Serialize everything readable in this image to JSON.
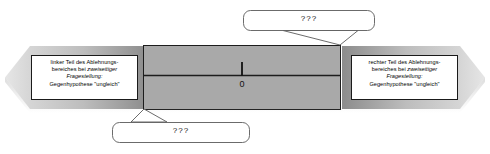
{
  "figure": {
    "axis": {
      "center_tick_label": "0",
      "center_tick_value": 0
    },
    "colors": {
      "band_light": "#d9d9d9",
      "band_mid": "#b4b4b4",
      "band_dark": "#8f8f8f",
      "center_fill": "#a8a8a8",
      "outline": "#1a1a1a",
      "callout_fill": "#ffffff",
      "callout_stroke": "#555555",
      "text": "#000000"
    },
    "left_region": {
      "name": "left-rejection-region",
      "lines": [
        {
          "text": "linker Teil des Ablehnungs-",
          "style": "normal"
        },
        {
          "text": "bereiches bei ",
          "style": "normal",
          "emphasis": "zweiseitiger"
        },
        {
          "text": "Fragestellung:",
          "style": "italic"
        },
        {
          "text": "Gegenhypothese \"ungleich\"",
          "style": "normal"
        }
      ],
      "line1": "linker Teil des Ablehnungs-",
      "line2_plain": "bereiches bei ",
      "line2_italic": "zweiseitiger",
      "line3": "Fragestellung:",
      "line4": "Gegenhypothese \"ungleich\""
    },
    "right_region": {
      "name": "right-rejection-region",
      "lines": [
        {
          "text": "rechter Teil des Ablehnungs-",
          "style": "normal"
        },
        {
          "text": "bereiches bei ",
          "style": "normal",
          "emphasis": "zweiseitiger"
        },
        {
          "text": "Fragestellung:",
          "style": "italic"
        },
        {
          "text": "Gegenhypothese \"ungleich\"",
          "style": "normal"
        }
      ],
      "line1": "rechter Teil des Ablehnungs-",
      "line2_plain": "bereiches bei ",
      "line2_italic": "zweiseitiger",
      "line3": "Fragestellung:",
      "line4": "Gegenhypothese \"ungleich\""
    },
    "callouts": [
      {
        "id": "top-callout",
        "label": "???",
        "position": "top-right",
        "points_to": "right-boundary-of-acceptance-band"
      },
      {
        "id": "bottom-callout",
        "label": "???",
        "position": "bottom-left",
        "points_to": "left-boundary-of-acceptance-band"
      }
    ],
    "top_callout": {
      "label": "???"
    },
    "bottom_callout": {
      "label": "???"
    }
  }
}
